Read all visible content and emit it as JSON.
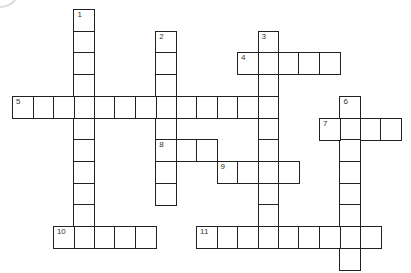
{
  "puzzle": {
    "origin": {
      "x": 12,
      "y": 9
    },
    "cell_w": 20.46,
    "cell_h": 21.7,
    "border_color": "#222222",
    "entries": [
      {
        "number": "1",
        "direction": "down",
        "col": 3,
        "row": 0,
        "length": 11
      },
      {
        "number": "2",
        "direction": "down",
        "col": 7,
        "row": 1,
        "length": 8
      },
      {
        "number": "3",
        "direction": "down",
        "col": 12,
        "row": 1,
        "length": 10
      },
      {
        "number": "4",
        "direction": "across",
        "col": 11,
        "row": 2,
        "length": 5
      },
      {
        "number": "5",
        "direction": "across",
        "col": 0,
        "row": 4,
        "length": 13
      },
      {
        "number": "6",
        "direction": "down",
        "col": 16,
        "row": 4,
        "length": 8
      },
      {
        "number": "7",
        "direction": "across",
        "col": 15,
        "row": 5,
        "length": 4
      },
      {
        "number": "8",
        "direction": "across",
        "col": 7,
        "row": 6,
        "length": 3
      },
      {
        "number": "9",
        "direction": "across",
        "col": 10,
        "row": 7,
        "length": 4
      },
      {
        "number": "10",
        "direction": "across",
        "col": 2,
        "row": 10,
        "length": 5
      },
      {
        "number": "11",
        "direction": "across",
        "col": 9,
        "row": 10,
        "length": 9
      }
    ]
  }
}
